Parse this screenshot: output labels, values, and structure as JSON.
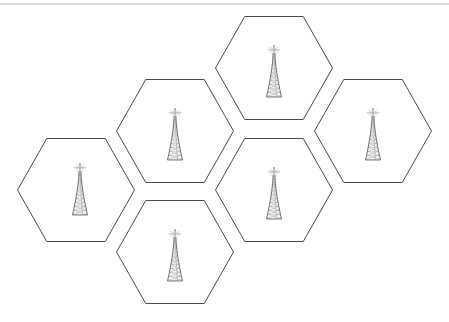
{
  "figure": {
    "kind": "cellular-network-hexagon-coverage-diagram",
    "background_color": "#ffffff",
    "width": 449,
    "height": 322,
    "hex_line_color": "#4a4a4a",
    "hex_fill_color": "#ffffff",
    "rule_color": "#b8b8b8",
    "tower_color": "#5a5a5a"
  },
  "top_rule": {
    "label": "horizontal-divider",
    "x1": 0,
    "y1": 4,
    "x2": 449,
    "y2": 4
  },
  "hex_geometry": {
    "orientation": "flat-top",
    "half_width": 58.5,
    "half_height": 51.5,
    "quarter_width": 29.25
  },
  "cells": [
    {
      "id": "cell-top",
      "label": "",
      "cx": 274,
      "cy": 68,
      "tower_id": "tower-top"
    },
    {
      "id": "cell-upper-left",
      "label": "",
      "cx": 175,
      "cy": 131,
      "tower_id": "tower-upper-left"
    },
    {
      "id": "cell-right",
      "label": "",
      "cx": 373,
      "cy": 131,
      "tower_id": "tower-right"
    },
    {
      "id": "cell-left",
      "label": "",
      "cx": 76,
      "cy": 190,
      "tower_id": "tower-left"
    },
    {
      "id": "cell-center",
      "label": "",
      "cx": 274,
      "cy": 190,
      "tower_id": "tower-center"
    },
    {
      "id": "cell-bottom",
      "label": "",
      "cx": 175,
      "cy": 252,
      "tower_id": "tower-bottom"
    }
  ],
  "towers": [
    {
      "id": "tower-top",
      "cx": 274,
      "base_y": 97,
      "height": 44,
      "base_half_width": 7.5
    },
    {
      "id": "tower-upper-left",
      "cx": 175,
      "base_y": 160,
      "height": 44,
      "base_half_width": 7.5
    },
    {
      "id": "tower-right",
      "cx": 373,
      "base_y": 160,
      "height": 44,
      "base_half_width": 7.5
    },
    {
      "id": "tower-left",
      "cx": 80,
      "base_y": 215,
      "height": 44,
      "base_half_width": 7.5
    },
    {
      "id": "tower-center",
      "cx": 274,
      "base_y": 219,
      "height": 44,
      "base_half_width": 7.5
    },
    {
      "id": "tower-bottom",
      "cx": 175,
      "base_y": 281,
      "height": 44,
      "base_half_width": 7.5
    }
  ],
  "chart_data": {
    "type": "diagram",
    "title": "",
    "cell_count": 6,
    "tower_count": 6,
    "adjacency": [
      [
        "cell-top",
        "cell-upper-left"
      ],
      [
        "cell-top",
        "cell-center"
      ],
      [
        "cell-top",
        "cell-right"
      ],
      [
        "cell-upper-left",
        "cell-left"
      ],
      [
        "cell-upper-left",
        "cell-center"
      ],
      [
        "cell-upper-left",
        "cell-bottom"
      ],
      [
        "cell-left",
        "cell-bottom"
      ],
      [
        "cell-center",
        "cell-right"
      ],
      [
        "cell-center",
        "cell-bottom"
      ]
    ]
  }
}
